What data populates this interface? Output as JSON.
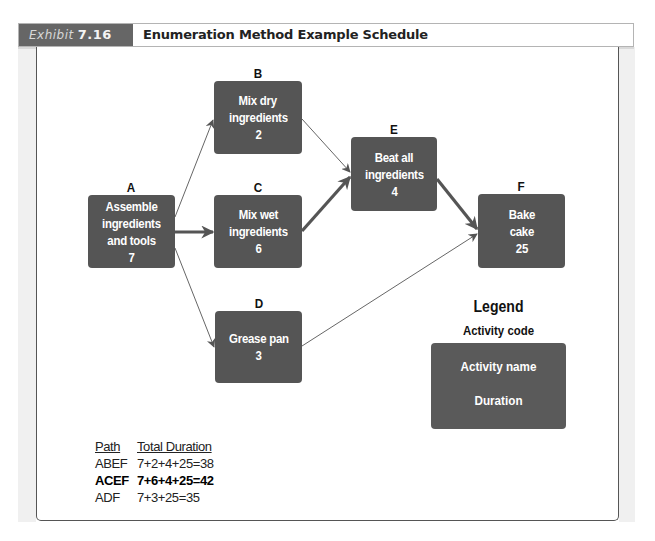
{
  "header": {
    "exhibit_word": "Exhibit",
    "exhibit_number": "7.16",
    "title": "Enumeration Method Example Schedule"
  },
  "colors": {
    "node_fill": "#555555",
    "exhibit_tag": "#666666",
    "arrow": "#555555"
  },
  "nodes": {
    "A": {
      "code": "A",
      "lines": [
        "Assemble",
        "ingredients",
        "and tools"
      ],
      "duration": "7"
    },
    "B": {
      "code": "B",
      "lines": [
        "Mix dry",
        "ingredients"
      ],
      "duration": "2"
    },
    "C": {
      "code": "C",
      "lines": [
        "Mix wet",
        "ingredients"
      ],
      "duration": "6"
    },
    "D": {
      "code": "D",
      "lines": [
        "Grease pan"
      ],
      "duration": "3"
    },
    "E": {
      "code": "E",
      "lines": [
        "Beat all",
        "ingredients"
      ],
      "duration": "4"
    },
    "F": {
      "code": "F",
      "lines": [
        "Bake",
        "cake"
      ],
      "duration": "25"
    }
  },
  "edges": [
    {
      "from": "A",
      "to": "B",
      "critical": false
    },
    {
      "from": "A",
      "to": "C",
      "critical": true
    },
    {
      "from": "A",
      "to": "D",
      "critical": false
    },
    {
      "from": "B",
      "to": "E",
      "critical": false
    },
    {
      "from": "C",
      "to": "E",
      "critical": true
    },
    {
      "from": "E",
      "to": "F",
      "critical": true
    },
    {
      "from": "D",
      "to": "F",
      "critical": false
    }
  ],
  "legend": {
    "title": "Legend",
    "code_label": "Activity code",
    "name_label": "Activity name",
    "duration_label": "Duration"
  },
  "paths_table": {
    "headers": [
      "Path",
      "Total Duration"
    ],
    "rows": [
      {
        "path": "ABEF",
        "total": "7+2+4+25=38",
        "critical": false
      },
      {
        "path": "ACEF",
        "total": "7+6+4+25=42",
        "critical": true
      },
      {
        "path": "ADF",
        "total": "7+3+25=35",
        "critical": false
      }
    ]
  }
}
